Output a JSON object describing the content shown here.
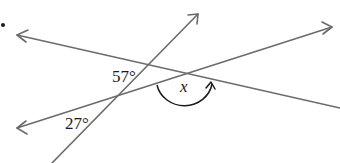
{
  "diagram": {
    "colors": {
      "line": "#6b6b6b",
      "arc": "#1a1a1a",
      "text": "#1a1a1a",
      "background": "#ffffff"
    },
    "labels": {
      "angle_top": "57°",
      "angle_bottom": "27°",
      "unknown": "x"
    },
    "lines": [
      {
        "name": "line-a",
        "description": "descending line, arrow pointing left",
        "arrow_end": "left"
      },
      {
        "name": "line-b",
        "description": "steep line, arrow pointing up-right",
        "arrow_end": "top-right"
      },
      {
        "name": "line-c",
        "description": "ascending line, arrows at both ends",
        "arrow_end": "both"
      }
    ],
    "marker": {
      "question_bullet": "•"
    }
  }
}
